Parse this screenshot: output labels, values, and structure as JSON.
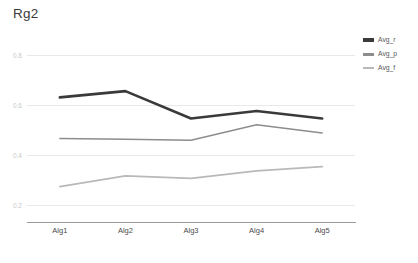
{
  "chart_data": {
    "type": "line",
    "title": "Rg2",
    "xlabel": "",
    "ylabel": "",
    "categories": [
      "Alg1",
      "Alg2",
      "Alg3",
      "Alg4",
      "Alg5"
    ],
    "series": [
      {
        "name": "Avg_r",
        "color": "#3a3a3a",
        "stroke_width": 2.6,
        "values": [
          0.63,
          0.655,
          0.545,
          0.575,
          0.545
        ]
      },
      {
        "name": "Avg_p",
        "color": "#8d8d8d",
        "stroke_width": 1.5,
        "values": [
          0.465,
          0.462,
          0.458,
          0.52,
          0.487
        ]
      },
      {
        "name": "Avg_f",
        "color": "#b9b9b9",
        "stroke_width": 1.8,
        "values": [
          0.272,
          0.315,
          0.305,
          0.335,
          0.352
        ]
      }
    ],
    "ylim": [
      0.13,
      0.86
    ],
    "yticks": [
      0.8,
      0.6,
      0.4,
      0.2
    ],
    "ytick_labels": [
      "0.8",
      "0.6",
      "0.4",
      "0.2"
    ],
    "grid": true,
    "grid_color": "#e9e9e9",
    "axis_color": "#9a9a9a",
    "legend_position": "right"
  },
  "legend": {
    "items": [
      {
        "label": "Avg_r"
      },
      {
        "label": "Avg_p"
      },
      {
        "label": "Avg_f"
      }
    ]
  }
}
